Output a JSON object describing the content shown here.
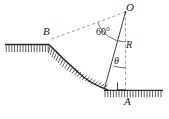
{
  "figure": {
    "type": "engineering-diagram",
    "background_color": "#ffffff",
    "line_color": "#1a1a1a",
    "dashed_color": "#808080",
    "labels": {
      "center_point": "O",
      "crest_point": "B",
      "toe_point": "A",
      "radius": "R",
      "arc_angle": "60°",
      "variable_angle": "θ"
    },
    "elements": {
      "ground_left": {
        "name": "upper-ground-surface",
        "hatched": true,
        "orientation": "horizontal"
      },
      "ground_right": {
        "name": "lower-ground-surface",
        "hatched": true,
        "orientation": "horizontal"
      },
      "slip_arc": {
        "name": "circular-slip-surface",
        "hatched": true,
        "from": "B",
        "to": "A"
      },
      "radius_to_B": {
        "name": "radius-line-to-B",
        "style": "dashed"
      },
      "radius_to_A": {
        "name": "radius-line-to-A",
        "style": "dashed",
        "orientation": "vertical"
      },
      "radius_variable": {
        "name": "radius-line-variable",
        "style": "solid"
      },
      "right_angle_marker": {
        "name": "right-angle-marker",
        "at": "A"
      },
      "arc_60": {
        "name": "angle-arc-60"
      },
      "arc_theta": {
        "name": "angle-arc-theta"
      }
    }
  }
}
